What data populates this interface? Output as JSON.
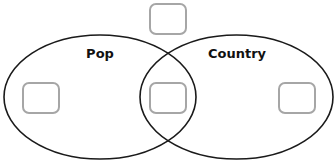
{
  "diagram": {
    "type": "venn",
    "sets": [
      {
        "id": "pop",
        "label": "Pop"
      },
      {
        "id": "country",
        "label": "Country"
      }
    ],
    "colors": {
      "ellipse_stroke": "#1a1a1a",
      "box_stroke": "#a6a6a6",
      "label_text": "#111111",
      "background": "#ffffff"
    },
    "regions": [
      {
        "id": "outside",
        "description": "Neither",
        "box_content": ""
      },
      {
        "id": "pop-only",
        "description": "Pop only",
        "box_content": ""
      },
      {
        "id": "both",
        "description": "Pop and Country",
        "box_content": ""
      },
      {
        "id": "country-only",
        "description": "Country only",
        "box_content": ""
      }
    ]
  }
}
